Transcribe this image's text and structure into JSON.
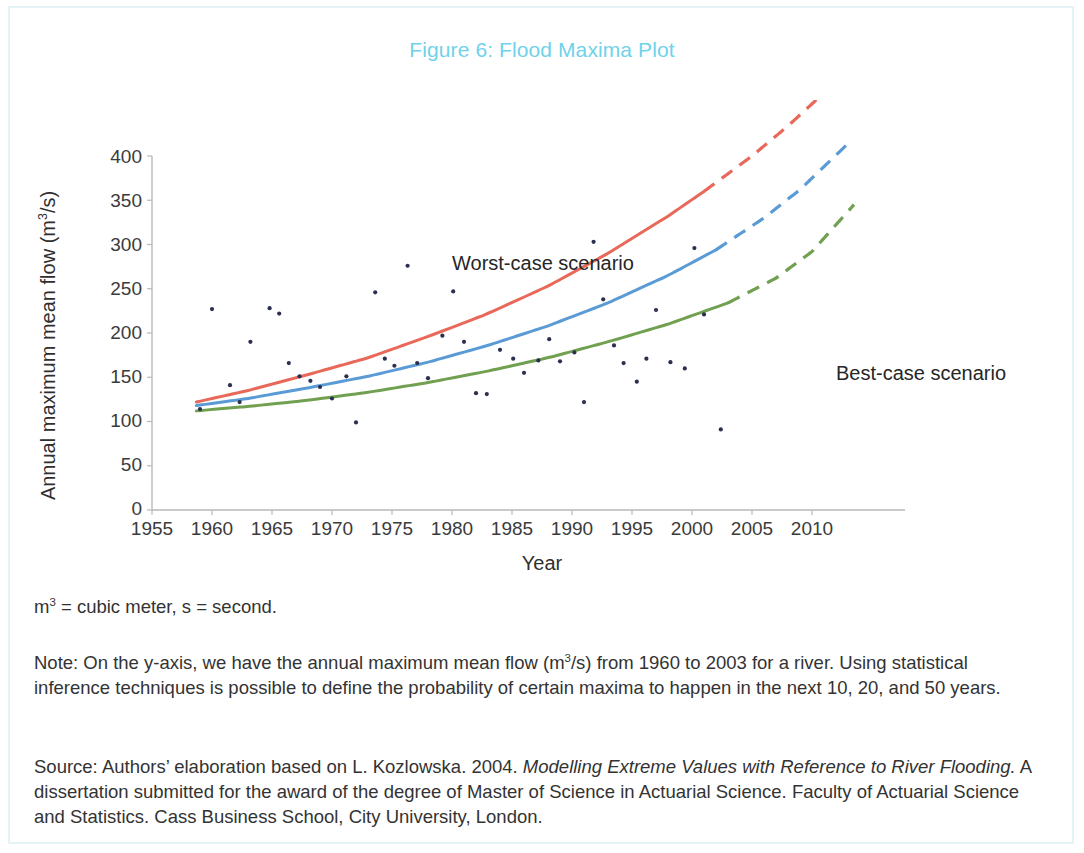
{
  "figure": {
    "title": "Figure 6: Flood Maxima Plot",
    "title_color": "#6fd2ea",
    "border_color": "#e3f3f6"
  },
  "annotations": {
    "worst": "Worst-case scenario",
    "best": "Best-case scenario"
  },
  "axes": {
    "y_title_main": "Annual maximum mean flow (m",
    "y_title_sup": "3",
    "y_title_tail": "/s)",
    "x_title": "Year"
  },
  "notes": {
    "units_prefix": "m",
    "units_sup": "3",
    "units_rest": " = cubic meter, s = second.",
    "note_part1": "Note: On the y-axis, we have the annual maximum mean flow (m",
    "note_sup": "3",
    "note_part2": "/s) from 1960 to 2003 for a river. Using statistical inference techniques is possible to define the probability of certain maxima to happen in the next 10, 20, and 50 years.",
    "source_part1": "Source: Authors’ elaboration based on L. Kozlowska. 2004. ",
    "source_italic": "Modelling Extreme Values with Reference to River Flooding.",
    "source_part2": " A dissertation submitted for the award of the degree of Master of Science in Actuarial Science. Faculty of Actuarial Science and Statistics. Cass Business School, City University, London."
  },
  "chart_data": {
    "type": "scatter",
    "title": "Figure 6: Flood Maxima Plot",
    "xlabel": "Year",
    "ylabel": "Annual maximum mean flow (m3/s)",
    "xlim": [
      1955,
      2013
    ],
    "ylim": [
      0,
      400
    ],
    "xticks": [
      1955,
      1960,
      1965,
      1970,
      1975,
      1980,
      1985,
      1990,
      1995,
      2000,
      2005,
      2010
    ],
    "yticks": [
      0,
      50,
      100,
      150,
      200,
      250,
      300,
      350,
      400
    ],
    "grid": false,
    "legend": "annotations-on-plot",
    "scatter": {
      "name": "Annual maximum mean flow observations",
      "color": "#2b2f50",
      "points": [
        [
          1959.0,
          114
        ],
        [
          1960.0,
          227
        ],
        [
          1961.5,
          141
        ],
        [
          1962.3,
          122
        ],
        [
          1963.2,
          190
        ],
        [
          1964.8,
          228
        ],
        [
          1965.6,
          222
        ],
        [
          1966.4,
          166
        ],
        [
          1967.3,
          151
        ],
        [
          1968.2,
          146
        ],
        [
          1969.0,
          139
        ],
        [
          1970.0,
          126
        ],
        [
          1971.2,
          151
        ],
        [
          1972.0,
          99
        ],
        [
          1973.6,
          246
        ],
        [
          1974.4,
          171
        ],
        [
          1975.2,
          163
        ],
        [
          1976.3,
          276
        ],
        [
          1977.1,
          166
        ],
        [
          1978.0,
          149
        ],
        [
          1979.2,
          197
        ],
        [
          1980.1,
          247
        ],
        [
          1981.0,
          190
        ],
        [
          1982.0,
          132
        ],
        [
          1982.9,
          131
        ],
        [
          1984.0,
          181
        ],
        [
          1985.1,
          171
        ],
        [
          1986.0,
          155
        ],
        [
          1987.2,
          169
        ],
        [
          1988.1,
          193
        ],
        [
          1989.0,
          168
        ],
        [
          1990.2,
          178
        ],
        [
          1991.0,
          122
        ],
        [
          1991.8,
          303
        ],
        [
          1992.6,
          238
        ],
        [
          1993.5,
          186
        ],
        [
          1994.3,
          166
        ],
        [
          1995.4,
          145
        ],
        [
          1996.2,
          171
        ],
        [
          1997.0,
          226
        ],
        [
          1998.2,
          167
        ],
        [
          1999.4,
          160
        ],
        [
          2000.2,
          296
        ],
        [
          2001.0,
          221
        ],
        [
          2002.4,
          91
        ]
      ]
    },
    "series": [
      {
        "name": "Worst-case scenario",
        "color": "#e8685a",
        "solid_x": [
          1958.7,
          2001
        ],
        "dashed_x": [
          2001,
          2012.5
        ],
        "points": [
          [
            1958.7,
            122
          ],
          [
            1963,
            135
          ],
          [
            1968,
            153
          ],
          [
            1973,
            172
          ],
          [
            1978,
            196
          ],
          [
            1983,
            222
          ],
          [
            1988,
            253
          ],
          [
            1993,
            290
          ],
          [
            1998,
            332
          ],
          [
            2001,
            360
          ],
          [
            2005,
            400
          ],
          [
            2008,
            434
          ],
          [
            2012.5,
            490
          ]
        ]
      },
      {
        "name": "Mid scenario",
        "color": "#5b9bd5",
        "solid_x": [
          1958.7,
          2002
        ],
        "dashed_x": [
          2002,
          2013
        ],
        "points": [
          [
            1958.7,
            118
          ],
          [
            1963,
            126
          ],
          [
            1968,
            138
          ],
          [
            1973,
            151
          ],
          [
            1978,
            167
          ],
          [
            1983,
            186
          ],
          [
            1988,
            208
          ],
          [
            1993,
            234
          ],
          [
            1998,
            265
          ],
          [
            2002,
            294
          ],
          [
            2006,
            330
          ],
          [
            2009,
            362
          ],
          [
            2013,
            414
          ]
        ]
      },
      {
        "name": "Best-case scenario",
        "color": "#70a050",
        "solid_x": [
          1958.7,
          2003
        ],
        "dashed_x": [
          2003,
          2013.5
        ],
        "points": [
          [
            1958.7,
            112
          ],
          [
            1963,
            117
          ],
          [
            1968,
            124
          ],
          [
            1973,
            133
          ],
          [
            1978,
            144
          ],
          [
            1983,
            157
          ],
          [
            1988,
            172
          ],
          [
            1993,
            190
          ],
          [
            1998,
            210
          ],
          [
            2003,
            234
          ],
          [
            2007,
            262
          ],
          [
            2010,
            292
          ],
          [
            2013.5,
            345
          ]
        ]
      }
    ]
  }
}
